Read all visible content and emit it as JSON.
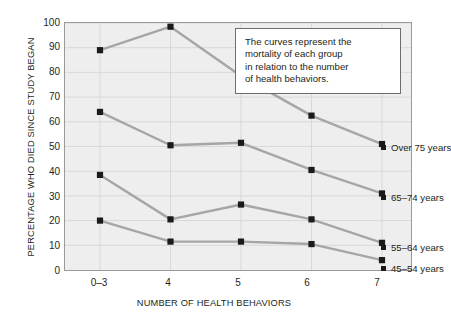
{
  "chart_data": {
    "type": "line",
    "title": "",
    "xlabel": "NUMBER OF HEALTH BEHAVIORS",
    "ylabel": "PERCENTAGE WHO DIED SINCE STUDY BEGAN",
    "categories": [
      "0–3",
      "4",
      "5",
      "6",
      "7"
    ],
    "xtick_labels": [
      "0–3",
      "4",
      "5",
      "6",
      "7"
    ],
    "ytick_labels": [
      "100",
      "90",
      "80",
      "70",
      "60",
      "50",
      "40",
      "30",
      "20",
      "10",
      "0"
    ],
    "ylim": [
      0,
      100
    ],
    "ytick_step": 10,
    "grid": true,
    "legend_position": "inline-right",
    "series": [
      {
        "name": "Over 75 years",
        "values": [
          89,
          98.5,
          78.5,
          62.5,
          51
        ]
      },
      {
        "name": "65–74 years",
        "values": [
          64,
          50.5,
          51.5,
          40.5,
          31
        ]
      },
      {
        "name": "55–64 years",
        "values": [
          38.5,
          20.5,
          26.5,
          20.5,
          11
        ]
      },
      {
        "name": "45–54 years",
        "values": [
          20,
          11.5,
          11.5,
          10.5,
          4
        ]
      }
    ],
    "annotations": [
      {
        "text": "The curves represent the mortality of each group in relation to the number of health behaviors."
      }
    ],
    "colors": {
      "plot_background": "#eeeeee",
      "plot_border": "#9a9a9a",
      "gridline": "#d8d8d8",
      "line": "#a6a6a6",
      "marker": "#1a1a1a",
      "text": "#231f20",
      "note_border": "#6d6d6d",
      "note_background": "#ffffff"
    }
  },
  "note": {
    "line1": "The curves represent the",
    "line2": "mortality of each group",
    "line3": "in relation to the number",
    "line4": "of health behaviors."
  },
  "labels": {
    "series_over75": "Over 75 years",
    "series_65_74": "65–74 years",
    "series_55_64": "55–64 years",
    "series_45_54": "45–54 years",
    "y_axis_title": "PERCENTAGE WHO DIED SINCE STUDY BEGAN",
    "x_axis_title": "NUMBER OF HEALTH BEHAVIORS"
  },
  "yticks": {
    "t100": "100",
    "t90": "90",
    "t80": "80",
    "t70": "70",
    "t60": "60",
    "t50": "50",
    "t40": "40",
    "t30": "30",
    "t20": "20",
    "t10": "10",
    "t0": "0"
  },
  "xticks": {
    "x0": "0–3",
    "x1": "4",
    "x2": "5",
    "x3": "6",
    "x4": "7"
  }
}
